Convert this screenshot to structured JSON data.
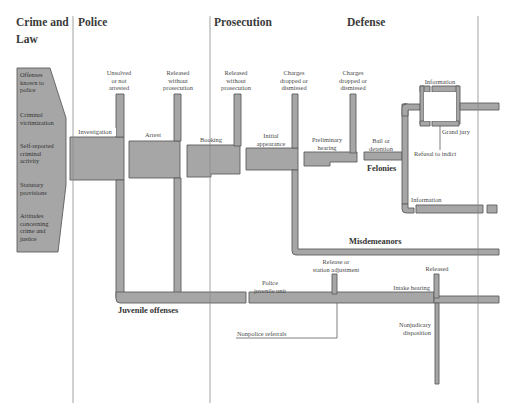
{
  "columns": {
    "crime_and_law": "Crime and\nLaw",
    "crime_and_law_line1": "Crime and",
    "crime_and_law_line2": "Law",
    "police": "Police",
    "prosecution": "Prosecution",
    "defense": "Defense"
  },
  "sources": [
    "Offenses known to police",
    "Criminal victimization",
    "Self-reported criminal activity",
    "Statutory provisions",
    "Attitudes concerning crime and justice"
  ],
  "source_lines": {
    "s0": [
      "Offenses",
      "known to",
      "police"
    ],
    "s1": [
      "Criminal",
      "victimization"
    ],
    "s2": [
      "Self-reported",
      "criminal",
      "activity"
    ],
    "s3": [
      "Statutory",
      "provisions"
    ],
    "s4": [
      "Attitudes",
      "concerning",
      "crime and",
      "justice"
    ]
  },
  "stages": {
    "investigation": "Investigation",
    "arrest": "Arrest",
    "booking": "Booking",
    "initial_appearance_1": "Initial",
    "initial_appearance_2": "appearance",
    "preliminary_hearing_1": "Preliminary",
    "preliminary_hearing_2": "hearing",
    "bail_1": "Bail or",
    "bail_2": "detention",
    "information_top": "Information",
    "grand_jury": "Grand jury",
    "refusal_to_indict": "Refusal to indict",
    "information_bottom": "Information",
    "police_juvenile_1": "Police",
    "police_juvenile_2": "juvenile unit",
    "intake_hearing": "Intake hearing",
    "nonpolice_referrals": "Nonpolice referrals",
    "nonjudicary_1": "Nonjudicary",
    "nonjudicary_2": "disposition"
  },
  "exits": {
    "unsolved_1": "Unsolved",
    "unsolved_2": "or not",
    "unsolved_3": "arrested",
    "released1_1": "Released",
    "released1_2": "without",
    "released1_3": "prosecution",
    "released2_1": "Released",
    "released2_2": "without",
    "released2_3": "prosecution",
    "charges1_1": "Charges",
    "charges1_2": "dropped or",
    "charges1_3": "dismissed",
    "charges2_1": "Charges",
    "charges2_2": "dropped or",
    "charges2_3": "dismissed",
    "release_station_1": "Release or",
    "release_station_2": "station adjustment",
    "released_juvenile": "Released"
  },
  "categories": {
    "felonies": "Felonies",
    "misdemeanors": "Misdemeanors",
    "juvenile_offenses": "Juvenile offenses"
  },
  "colors": {
    "flow_fill": "#a6a6a6",
    "flow_stroke": "#5e5e5e",
    "divider": "#8a8a8a",
    "text": "#3a3a3a"
  }
}
